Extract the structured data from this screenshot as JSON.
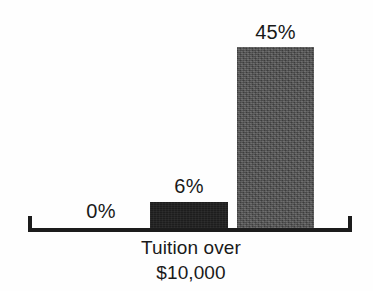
{
  "chart_data": {
    "type": "bar",
    "title": "",
    "subtitle": "",
    "xlabel": "Tuition over $10,000",
    "ylabel": "",
    "categories": [
      "",
      "",
      ""
    ],
    "values": [
      0,
      6,
      45
    ],
    "data_labels": [
      "0%",
      "6%",
      "45%"
    ],
    "ylim": [
      0,
      50
    ],
    "grid": false,
    "legend": null,
    "axis": {
      "baseline_visible": true,
      "end_ticks": true,
      "tick_labels": []
    },
    "series": [
      {
        "name": "Percent",
        "values": [
          0,
          6,
          45
        ],
        "labels": [
          "0%",
          "6%",
          "45%"
        ],
        "colors": [
          "#ffffff",
          "#1d1d1d",
          "#4b4b4b"
        ]
      }
    ]
  },
  "chart": {
    "caption": {
      "line1": "Tuition over",
      "line2": "$10,000"
    },
    "bars": [
      {
        "label": "0%",
        "value": 0,
        "fill": "none"
      },
      {
        "label": "6%",
        "value": 6,
        "fill": "dark"
      },
      {
        "label": "45%",
        "value": 45,
        "fill": "gray"
      }
    ],
    "colors": {
      "background": "#fefefe",
      "axis": "#1c1c1c",
      "text": "#191919",
      "bar_dark": "#1d1d1d",
      "bar_gray": "#4b4b4b"
    }
  }
}
